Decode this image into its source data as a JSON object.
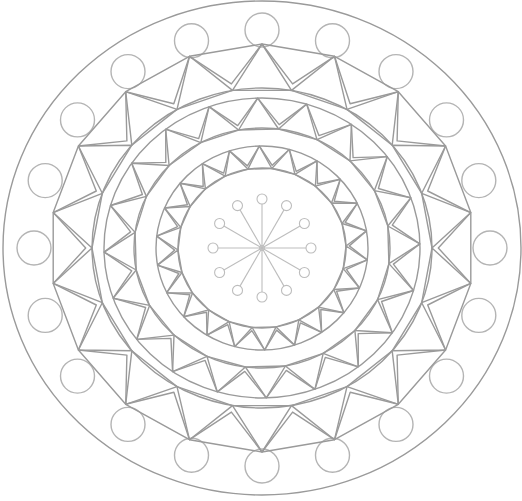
{
  "image": {
    "subject": "Mandala coloring page line drawing",
    "width": 522,
    "height": 501,
    "background": "#ffffff"
  },
  "colors": {
    "stroke": "#9a9a9a",
    "stroke_light": "#b4b4b4",
    "center_stroke": "#bdbdbd"
  },
  "mandala": {
    "center": [
      262,
      248
    ],
    "outer_circle": {
      "rx": 259,
      "ry": 247
    },
    "bead_ring": {
      "count": 20,
      "radius_x": 228,
      "radius_y": 218,
      "bead_r": 17,
      "offset_deg": -90
    },
    "triangle_rings": [
      {
        "name": "outer-triangle-ring",
        "inner_rx": 170,
        "inner_ry": 160,
        "outer_rx": 212,
        "outer_ry": 204,
        "count": 18,
        "band_circle": "inner"
      },
      {
        "name": "middle-triangle-ring",
        "inner_rx": 128,
        "inner_ry": 120,
        "outer_rx": 158,
        "outer_ry": 150,
        "count": 20,
        "band_circle": "both"
      },
      {
        "name": "inner-triangle-ring",
        "inner_rx": 84,
        "inner_ry": 80,
        "outer_rx": 106,
        "outer_ry": 102,
        "count": 22,
        "band_circle": "both"
      }
    ],
    "center_star": {
      "spokes": 12,
      "length": 44,
      "knob_r": 5
    }
  }
}
